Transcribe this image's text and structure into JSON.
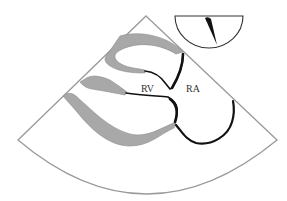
{
  "diagram": {
    "type": "echocardiography-sector-view",
    "labels": {
      "rv": "RV",
      "ra": "RA"
    },
    "colors": {
      "sector_outline": "#9a9a9a",
      "wall_gray": "#a8a8a8",
      "wall_gray_stroke": "#8c8c8c",
      "chamber_line": "#111111",
      "inset_outline": "#333333",
      "background": "#ffffff"
    },
    "elements": [
      {
        "name": "sector-outline",
        "description": "ultrasound fan-shaped scan sector"
      },
      {
        "name": "probe-orientation-inset",
        "description": "semicircle with needle indicating imaging plane"
      },
      {
        "name": "gray-wall-band",
        "count": 3
      },
      {
        "name": "black-chamber-boundaries",
        "count": 3
      }
    ]
  }
}
